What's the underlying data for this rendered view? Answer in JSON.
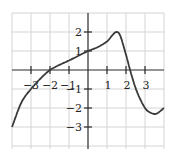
{
  "chart_data": {
    "type": "line",
    "title": "",
    "xlabel": "",
    "ylabel": "",
    "xlim": [
      -4,
      4
    ],
    "ylim": [
      -4.2,
      3
    ],
    "grid": true,
    "x_ticks": [
      "-3",
      "-2",
      "-1",
      "1",
      "2",
      "3"
    ],
    "y_ticks": [
      "2",
      "1",
      "-1",
      "-2",
      "-3"
    ],
    "series": [
      {
        "name": "f(x)",
        "x": [
          -4,
          -3.5,
          -3,
          -2.5,
          -2,
          -1.5,
          -1,
          -0.5,
          0,
          0.5,
          1,
          1.3,
          1.5,
          1.7,
          2,
          2.3,
          2.6,
          3,
          3.3,
          3.6,
          4
        ],
        "values": [
          -3,
          -1.7,
          -1,
          -0.45,
          0,
          0.27,
          0.5,
          0.75,
          1,
          1.2,
          1.5,
          1.85,
          2,
          1.8,
          0.8,
          -0.3,
          -1.2,
          -2.0,
          -2.25,
          -2.3,
          -2.0
        ]
      }
    ],
    "key_points": {
      "x_intercepts": [
        -2,
        2.3
      ],
      "y_intercept": 1,
      "local_max": [
        1.5,
        2
      ],
      "local_min": [
        3.6,
        -2.3
      ],
      "left_endpoint": [
        -4,
        -3
      ],
      "right_endpoint": [
        4,
        -2
      ]
    }
  },
  "labels": {
    "x": {
      "m3": "−3",
      "m2": "−2",
      "m1": "−1",
      "p1": "1",
      "p2": "2",
      "p3": "3"
    },
    "y": {
      "p2": "2",
      "p1": "1",
      "m1": "−1",
      "m2": "−2",
      "m3": "−3"
    }
  }
}
